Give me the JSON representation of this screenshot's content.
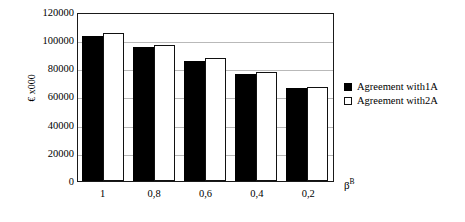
{
  "chart_data": {
    "type": "bar",
    "title": "",
    "xlabel": "β",
    "xlabel_superscript": "B",
    "ylabel": "€ x000",
    "categories": [
      "1",
      "0,8",
      "0,6",
      "0,4",
      "0,2"
    ],
    "series": [
      {
        "name": "Agreement  with1A",
        "values": [
          103000,
          95000,
          85500,
          76000,
          66000
        ],
        "color": "#000000",
        "style": "filled"
      },
      {
        "name": "Agreement  with2A",
        "values": [
          105000,
          96500,
          87000,
          77500,
          67000
        ],
        "color": "#ffffff",
        "style": "outlined"
      }
    ],
    "ylim": [
      0,
      120000
    ],
    "yticks": [
      0,
      20000,
      40000,
      60000,
      80000,
      100000,
      120000
    ],
    "ytick_labels": [
      "0",
      "20000",
      "40000",
      "60000",
      "80000",
      "100000",
      "120000"
    ],
    "grid": true,
    "grid_axis": "y",
    "legend_position": "right",
    "frame_color": "#1a1a1a",
    "gridline_color": "#b9b9b9",
    "background": "#ffffff"
  }
}
